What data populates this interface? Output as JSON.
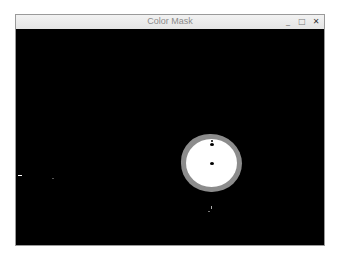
{
  "window": {
    "title": "Color Mask",
    "controls": {
      "minimize": "_",
      "maximize": "□",
      "close": "✕"
    }
  },
  "canvas": {
    "background": "#000000",
    "mask_blob": {
      "fill": "#ffffff",
      "edge": "#8c8c8c"
    }
  }
}
